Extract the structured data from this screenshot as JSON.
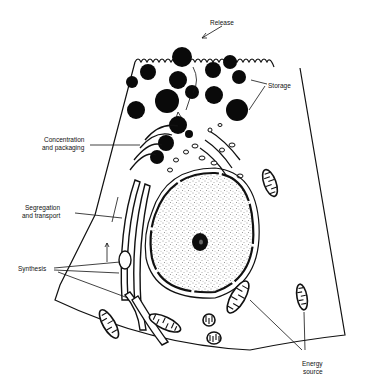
{
  "diagram": {
    "labels": {
      "release": "Release",
      "storage": "Storage",
      "concentration_line1": "Concentration",
      "concentration_line2": "and packaging",
      "segregation_line1": "Segregation",
      "segregation_line2": "and transport",
      "synthesis": "Synthesis",
      "energy_line1": "Energy",
      "energy_line2": "source"
    },
    "structures": [
      "plasma-membrane-microvilli",
      "secretory-granules",
      "golgi-complex",
      "rough-endoplasmic-reticulum",
      "nucleus",
      "nucleolus",
      "mitochondria"
    ],
    "colors": {
      "ink": "#111111",
      "background": "#ffffff"
    }
  }
}
